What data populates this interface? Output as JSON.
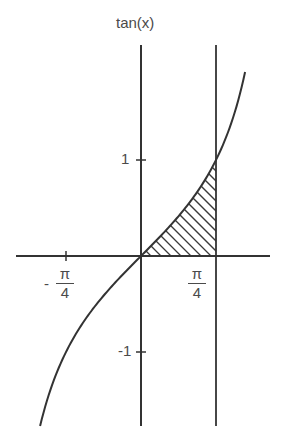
{
  "chart_data": {
    "type": "line",
    "title": "tan(x)",
    "ylabel": "tan(x)",
    "xlabel": "",
    "function": "tan(x)",
    "x_ticks": [
      {
        "value": -0.7854,
        "label": "-π/4"
      },
      {
        "value": 0.7854,
        "label": "π/4"
      }
    ],
    "y_ticks": [
      {
        "value": 1,
        "label": "1"
      },
      {
        "value": -1,
        "label": "-1"
      }
    ],
    "xlim": [
      -1.65,
      1.35
    ],
    "ylim": [
      -1.77,
      1.92
    ],
    "vertical_line": {
      "x": 0.7854,
      "label": "x = π/4"
    },
    "shaded_region": {
      "from": 0,
      "to": 0.7854,
      "between": [
        "tan(x)",
        "x-axis"
      ],
      "style": "hatched"
    },
    "grid": false,
    "legend": null
  },
  "labels": {
    "y_axis_title": "tan(x)",
    "tick_y_pos": "1",
    "tick_y_neg": "-1",
    "tick_x_neg_sign": "-",
    "tick_x_num": "π",
    "tick_x_den": "4"
  }
}
